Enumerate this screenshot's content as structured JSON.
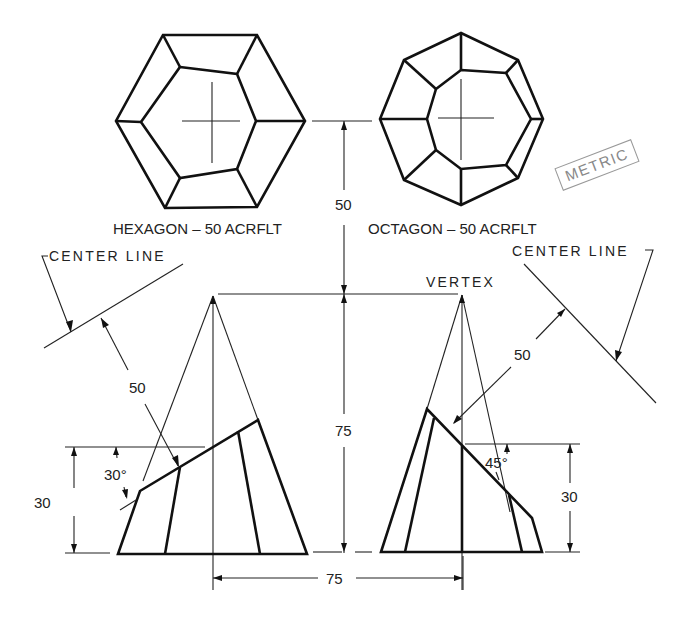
{
  "views": {
    "hexagon": {
      "label": "HEXAGON – 50 ACRFLT",
      "outer": [
        [
          163,
          35
        ],
        [
          257,
          35
        ],
        [
          305,
          121
        ],
        [
          257,
          207
        ],
        [
          165,
          208
        ],
        [
          116,
          121
        ]
      ],
      "inner": [
        [
          180,
          67
        ],
        [
          237,
          74
        ],
        [
          256,
          121
        ],
        [
          237,
          169
        ],
        [
          180,
          178
        ],
        [
          141,
          122
        ]
      ],
      "center": [
        213,
        121
      ]
    },
    "octagon": {
      "label": "OCTAGON – 50 ACRFLT",
      "outer": [
        [
          461,
          33
        ],
        [
          518,
          60
        ],
        [
          543,
          119
        ],
        [
          518,
          178
        ],
        [
          461,
          205
        ],
        [
          404,
          180
        ],
        [
          380,
          119
        ],
        [
          404,
          60
        ]
      ],
      "inner": [
        [
          461,
          70
        ],
        [
          506,
          73
        ],
        [
          531,
          119
        ],
        [
          506,
          165
        ],
        [
          461,
          169
        ],
        [
          436,
          150
        ],
        [
          427,
          119
        ],
        [
          436,
          89
        ]
      ],
      "center": [
        461,
        119
      ]
    }
  },
  "annotations": {
    "center_line_left": "CENTER LINE",
    "center_line_right": "CENTER LINE",
    "vertex": "VERTEX",
    "metric_stamp": "METRIC"
  },
  "dimensions": {
    "top_height": "50",
    "cone_height": "75",
    "base_spacing": "75",
    "left_cut_height": "30",
    "right_cut_height": "30",
    "left_distance": "50",
    "right_distance": "50",
    "left_angle": "30°",
    "right_angle": "45°"
  },
  "colors": {
    "line": "#111111",
    "stamp": "#888888",
    "background": "#ffffff"
  }
}
